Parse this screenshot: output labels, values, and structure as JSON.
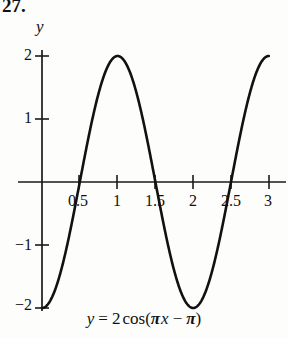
{
  "figure": {
    "exercise_number": "27.",
    "equation": {
      "lhs": "y",
      "eq": "=",
      "amplitude": "2",
      "function": "cos",
      "open_paren": "(",
      "pi1": "π",
      "x": "x",
      "minus": "−",
      "pi2": "π",
      "close_paren": ")",
      "plain": "y = 2cos(πx − π)"
    },
    "axis_label_y": "y",
    "curve_color": "#111111",
    "axis_color": "#1a1a1a",
    "background": "#fdfdfc"
  },
  "chart_data": {
    "type": "line",
    "title": "",
    "subtitle": "",
    "xlabel": "",
    "ylabel": "y",
    "equation": "y = 2cos(πx − π)",
    "xlim": [
      -0.25,
      3.25
    ],
    "ylim": [
      -2.35,
      2.35
    ],
    "grid": false,
    "legend": "none",
    "x_ticks": [
      0.5,
      1,
      1.5,
      2,
      2.5,
      3
    ],
    "x_tick_labels": [
      "0.5",
      "1",
      "1.5",
      "2",
      "2.5",
      "3"
    ],
    "y_ticks": [
      2,
      1,
      -1,
      -2
    ],
    "y_tick_labels": [
      "2",
      "1",
      "−1",
      "−2"
    ],
    "series": [
      {
        "name": "y = 2cos(πx − π)",
        "x": [
          0,
          0.1,
          0.2,
          0.3,
          0.4,
          0.5,
          0.6,
          0.7,
          0.8,
          0.9,
          1.0,
          1.1,
          1.2,
          1.3,
          1.4,
          1.5,
          1.6,
          1.7,
          1.8,
          1.9,
          2.0,
          2.1,
          2.2,
          2.3,
          2.4,
          2.5,
          2.6,
          2.7,
          2.8,
          2.9,
          3.0
        ],
        "y": [
          -2,
          -1.902,
          -1.618,
          -1.176,
          -0.618,
          0,
          0.618,
          1.176,
          1.618,
          1.902,
          2,
          1.902,
          1.618,
          1.176,
          0.618,
          0,
          -0.618,
          -1.176,
          -1.618,
          -1.902,
          -2,
          -1.902,
          -1.618,
          -1.176,
          -0.618,
          0,
          0.618,
          1.176,
          1.618,
          1.902,
          2
        ]
      }
    ],
    "key_points": {
      "start": {
        "x": 0,
        "y": -2
      },
      "maximum": {
        "x": 1,
        "y": 2
      },
      "minimum": {
        "x": 2,
        "y": -2
      },
      "end": {
        "x": 3,
        "y": 2
      },
      "zero_crossings": [
        0.5,
        1.5,
        2.5
      ]
    },
    "amplitude": 2,
    "period": 2,
    "phase_shift": 1
  }
}
